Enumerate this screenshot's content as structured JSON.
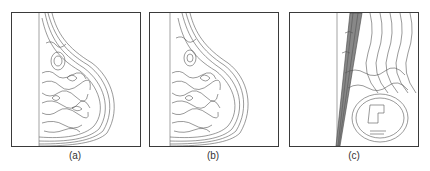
{
  "figure": {
    "panels": [
      {
        "id": "a",
        "caption": "(a)",
        "description": "contour line map of breast tissue, left-view mammogram edges"
      },
      {
        "id": "b",
        "caption": "(b)",
        "description": "contour line map of breast tissue, similar to (a)"
      },
      {
        "id": "c",
        "caption": "(c)",
        "description": "zoomed contour map with pectoral muscle band and circular mass region"
      }
    ],
    "colors": {
      "line": "#3a3a3a",
      "background": "#ffffff"
    }
  }
}
